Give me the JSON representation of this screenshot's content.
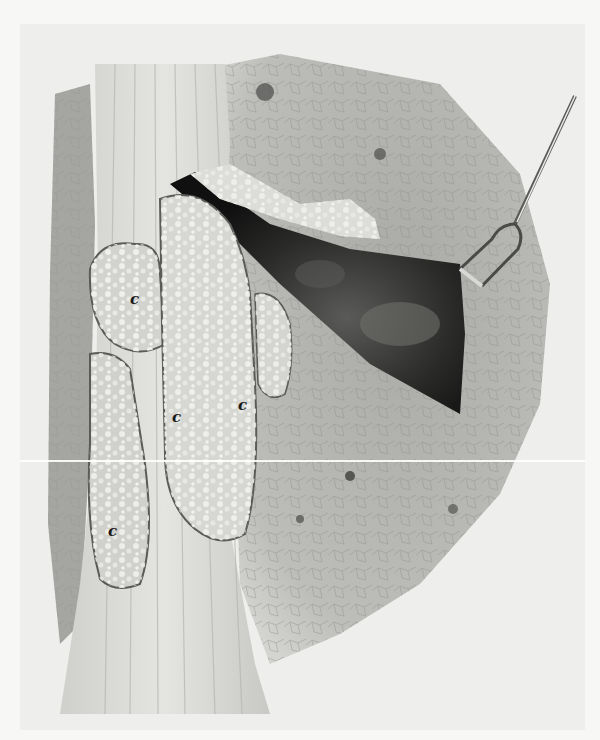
{
  "figure": {
    "colors": {
      "paper": "#f7f7f5",
      "plate": "#eeeeec",
      "lung": "#b9b9b6",
      "cavity": "#1c1c1c",
      "masses": "#d8d8d4",
      "band": "#dcdcd8"
    },
    "labels": [
      {
        "text": "c",
        "x": 110,
        "y": 268
      },
      {
        "text": "c",
        "x": 152,
        "y": 386
      },
      {
        "text": "c",
        "x": 218,
        "y": 374
      },
      {
        "text": "c",
        "x": 88,
        "y": 500
      }
    ],
    "instrument": "retractor-fork"
  }
}
